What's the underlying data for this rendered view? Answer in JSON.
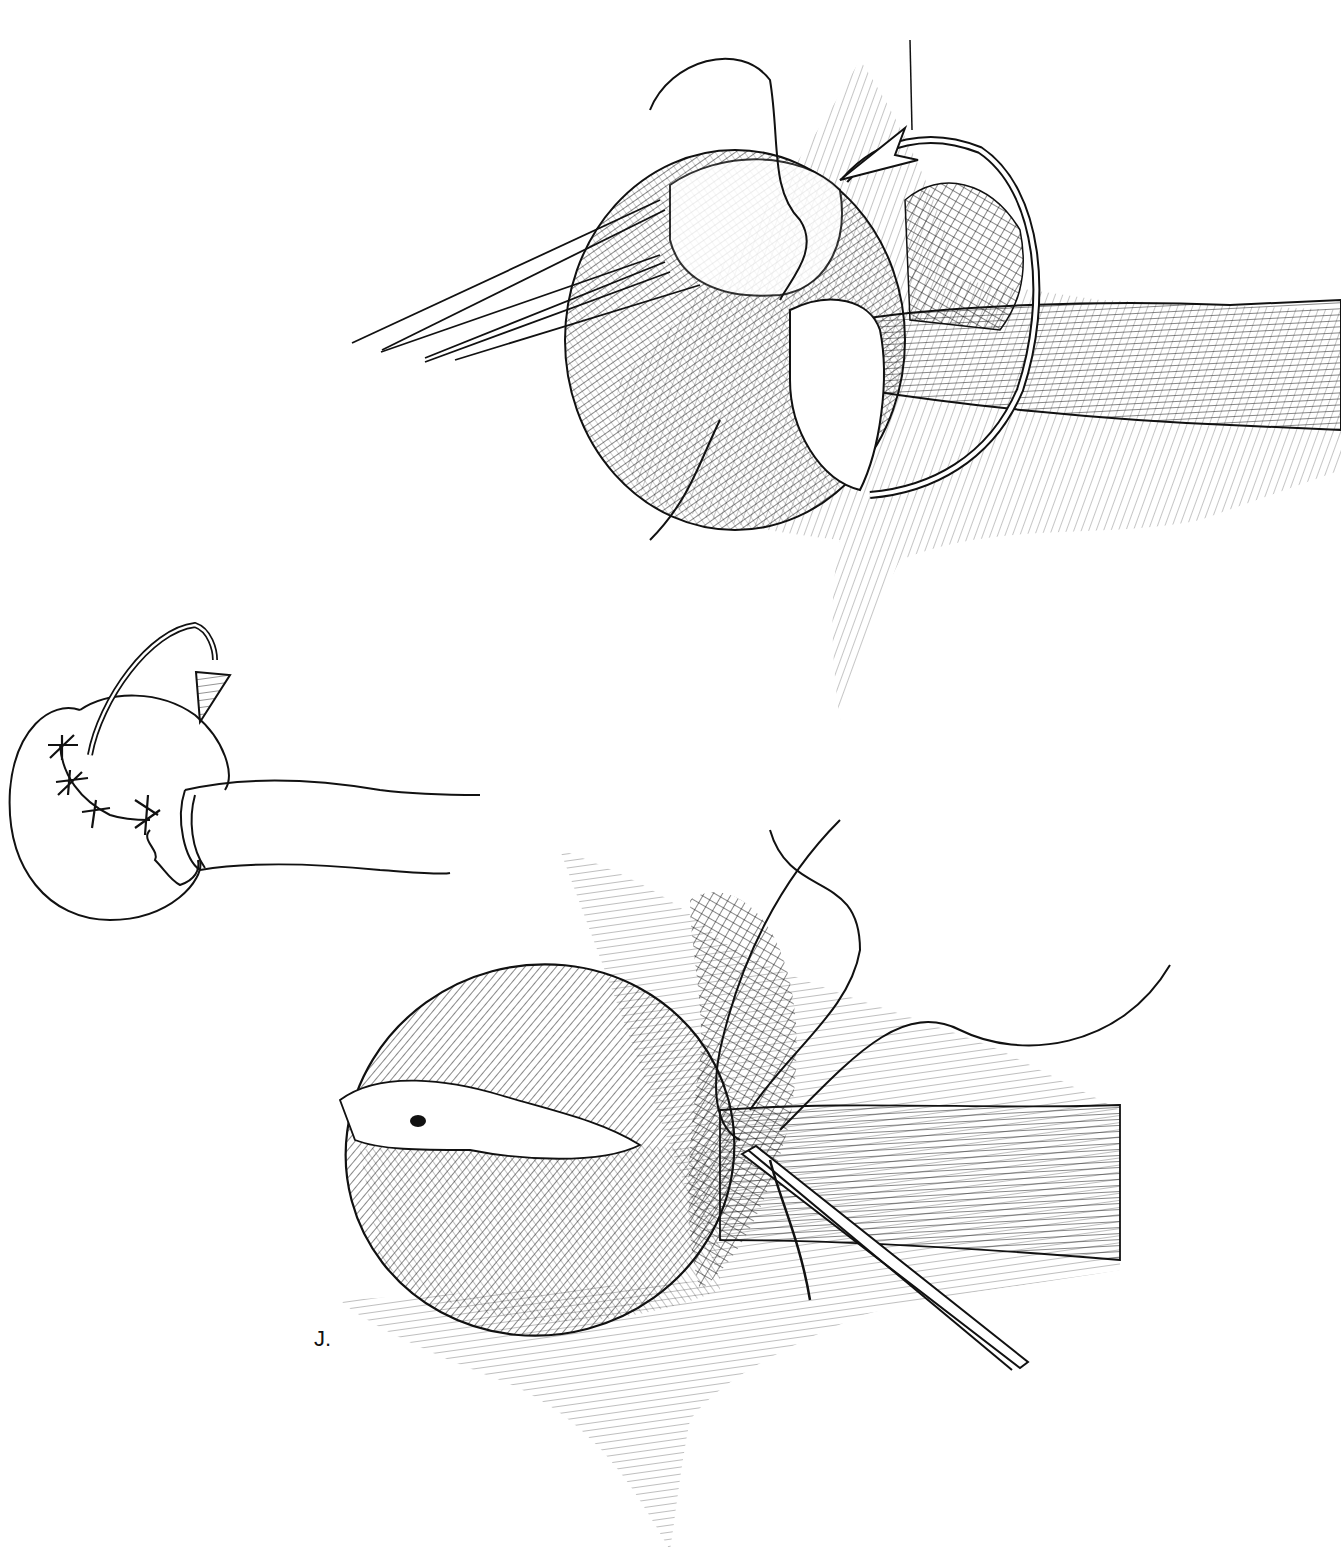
{
  "illustration": {
    "type": "surgical line-art illustration",
    "panel_label": "J.",
    "ink_color": "#111111",
    "background_color": "#ffffff",
    "panels": [
      {
        "id": "top",
        "description": "organ with three retraction sutures pulled to the left, curved rotation arrow at upper right, tubular structure exiting to the right"
      },
      {
        "id": "inset",
        "description": "simplified outline sketch of organ with interrupted sutures and curved downward arrow, tube to the right"
      },
      {
        "id": "bottom",
        "description": "rotated organ with sutured seam, needle holder/forceps and suture strands at the junction with tubular structure"
      }
    ]
  }
}
